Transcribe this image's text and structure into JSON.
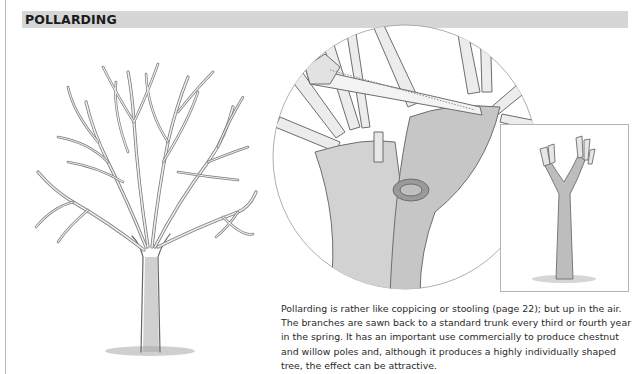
{
  "page": {
    "section_title": "POLLARDING",
    "caption": "Pollarding is rather like coppicing or stooling (page 22); but up in the air. The branches are sawn back to a standard trunk every third or fourth year in the spring. It has an important use commercially to produce chestnut and willow poles and, although it produces a highly individually shaped tree, the effect can be attractive."
  },
  "illustrations": [
    {
      "name": "pollarded-tree-full-crown",
      "description": "Pollarded tree with dense crown of regrowth shoots"
    },
    {
      "name": "saw-cutting-branches-closeup",
      "description": "Circular close-up of pruning saw cutting branches at pollard head"
    },
    {
      "name": "freshly-pollarded-trunk",
      "description": "Inset of trunk after branches are cut back"
    }
  ],
  "colors": {
    "header_bar": "#d6d6d6",
    "text": "#1a1a1a",
    "line_art": "#6a6a6a"
  }
}
